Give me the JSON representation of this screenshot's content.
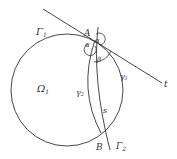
{
  "labels": {
    "gamma1_circle": "Γ",
    "gamma1_circle_sub": "1",
    "omega1": "Ω",
    "omega1_sub": "1",
    "A": "A",
    "B": "B",
    "alpha_left": "α",
    "alpha_right": "α",
    "beta": "β",
    "gamma1_arc": "γ",
    "gamma1_arc_sub": "1",
    "gamma2_arc": "γ",
    "gamma2_arc_sub": "2",
    "s": "s",
    "t": "t",
    "Gamma2": "Γ",
    "Gamma2_sub": "2"
  },
  "colors": {
    "stroke": "#333333",
    "background": "#ffffff"
  }
}
